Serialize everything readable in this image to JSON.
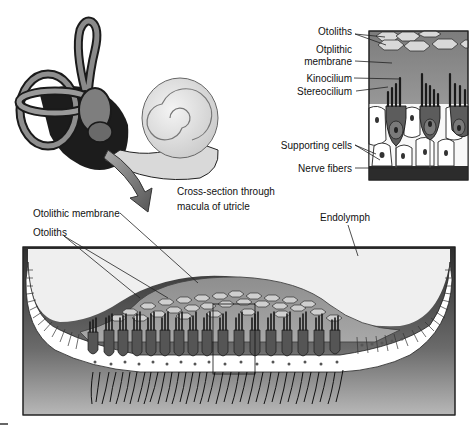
{
  "figure": {
    "ear_illustration": {
      "name": "inner ear (semicircular canals, vestibule, cochlea)",
      "caption_line1": "Cross-section through",
      "caption_line2": "macula of utricle"
    },
    "detail_inset": {
      "labels": {
        "otoliths": "Otoliths",
        "otolithic_membrane_line1": "Otplithic",
        "otolithic_membrane_line2": "membrane",
        "kinocilium": "Kinocilium",
        "stereocilium": "Stereocilium",
        "supporting_cells": "Supporting cells",
        "nerve_fibers": "Nerve fibers"
      }
    },
    "macula_cross_section": {
      "labels": {
        "otolithic_membrane": "Otolithic membrane",
        "otoliths": "Otoliths",
        "endolymph": "Endolymph"
      }
    }
  },
  "colors": {
    "endolymph": "#f2f2f2",
    "membrane": "#9a9a9a",
    "hair_cell": "#5a5a5a",
    "supporting_cell": "#ffffff",
    "tissue_dark": "#3a3a3a",
    "outline": "#1a1a1a"
  }
}
